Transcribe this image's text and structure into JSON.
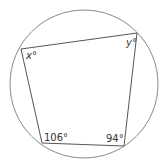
{
  "diagram": {
    "type": "cyclic-quadrilateral",
    "circle": {
      "cx": 84,
      "cy": 84,
      "r": 74,
      "stroke": "#888888"
    },
    "vertices": [
      {
        "name": "top-left",
        "x": 21,
        "y": 49,
        "label": "x°",
        "lx": 26,
        "ly": 59
      },
      {
        "name": "top-right",
        "x": 137,
        "y": 33,
        "label": "y°",
        "lx": 126,
        "ly": 46
      },
      {
        "name": "bottom-right",
        "x": 124,
        "y": 146,
        "label": "94°",
        "lx": 106,
        "ly": 142
      },
      {
        "name": "bottom-left",
        "x": 42,
        "y": 143,
        "label": "106°",
        "lx": 44,
        "ly": 141
      }
    ],
    "stroke": "#555555"
  }
}
